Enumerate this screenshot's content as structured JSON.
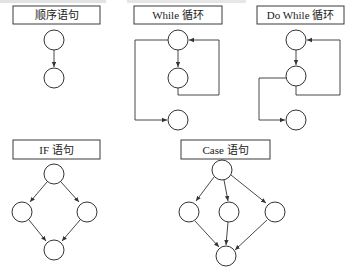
{
  "figure": {
    "panels": [
      {
        "id": "sequence",
        "title": "顺序语句"
      },
      {
        "id": "while",
        "title": "While 循环"
      },
      {
        "id": "do_while",
        "title": "Do While 循环"
      },
      {
        "id": "if",
        "title": "IF 语句"
      },
      {
        "id": "case",
        "title": "Case 语句"
      }
    ]
  },
  "colors": {
    "line": "#333333",
    "background": "#ffffff"
  }
}
